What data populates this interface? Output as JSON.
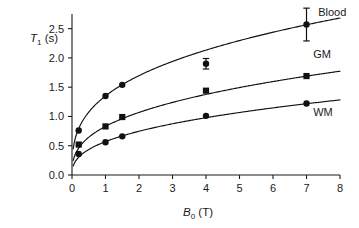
{
  "chart_data": {
    "type": "line",
    "title": "",
    "subtitle": "",
    "xlabel": "B0 (T)",
    "xlabel_base": "B",
    "xlabel_sub": "0",
    "xlabel_unit": " (T)",
    "ylabel": "T1 (s)",
    "ylabel_base": "T",
    "ylabel_sub": "1",
    "ylabel_unit": " (s)",
    "xlim": [
      0,
      8
    ],
    "ylim": [
      0,
      2.75
    ],
    "xticks": [
      0,
      1,
      2,
      3,
      4,
      5,
      6,
      7,
      8
    ],
    "xtick_labels": [
      "0",
      "1",
      "2",
      "3",
      "4",
      "5",
      "6",
      "7",
      "8"
    ],
    "yticks": [
      0.0,
      0.5,
      1.0,
      1.5,
      2.0,
      2.5
    ],
    "ytick_labels": [
      "0.0",
      "0.5",
      "1.0",
      "1.5",
      "2.0",
      "2.5"
    ],
    "grid": false,
    "legend_position": "inline-right-of-curves",
    "line_color": "#111111",
    "marker_color": "#111111",
    "series": [
      {
        "name": "Blood",
        "label": "Blood",
        "marker": "circle",
        "label_x": 7.35,
        "label_y": 2.72,
        "points": [
          {
            "x": 0.2,
            "y": 0.76
          },
          {
            "x": 1.0,
            "y": 1.35
          },
          {
            "x": 1.5,
            "y": 1.54
          },
          {
            "x": 4.0,
            "y": 1.9,
            "yerr": 0.09
          },
          {
            "x": 7.0,
            "y": 2.57,
            "yerr": 0.28
          }
        ],
        "fit": {
          "model": "a*x^b",
          "a": 1.35,
          "b": 0.33
        }
      },
      {
        "name": "GM",
        "label": "GM",
        "marker": "square",
        "label_x": 7.2,
        "label_y": 2.0,
        "points": [
          {
            "x": 0.2,
            "y": 0.52
          },
          {
            "x": 1.0,
            "y": 0.83
          },
          {
            "x": 1.5,
            "y": 0.99
          },
          {
            "x": 4.0,
            "y": 1.44
          },
          {
            "x": 7.0,
            "y": 1.69
          }
        ],
        "fit": {
          "model": "a*x^b",
          "a": 0.83,
          "b": 0.365
        }
      },
      {
        "name": "WM",
        "label": "WM",
        "marker": "circle",
        "label_x": 7.2,
        "label_y": 1.0,
        "points": [
          {
            "x": 0.2,
            "y": 0.36
          },
          {
            "x": 1.0,
            "y": 0.56
          },
          {
            "x": 1.5,
            "y": 0.66
          },
          {
            "x": 4.0,
            "y": 1.01
          },
          {
            "x": 7.0,
            "y": 1.22
          }
        ],
        "fit": {
          "model": "a*x^b",
          "a": 0.57,
          "b": 0.39
        }
      }
    ]
  }
}
